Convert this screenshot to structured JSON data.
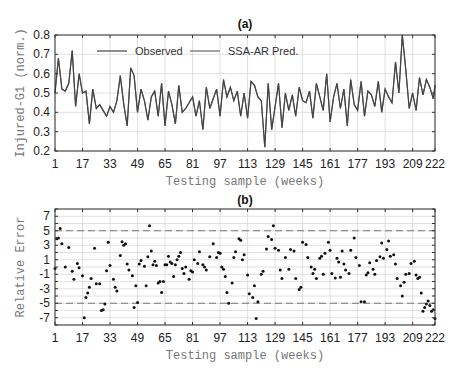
{
  "chart_data": [
    {
      "id": "a",
      "type": "line",
      "title": "(a)",
      "xlabel": "Testing sample (weeks)",
      "ylabel": "Injured-G1 (norm.)",
      "xlim": [
        1,
        222
      ],
      "ylim": [
        0.2,
        0.8
      ],
      "xticks": [
        1,
        17,
        33,
        49,
        65,
        81,
        97,
        113,
        129,
        145,
        161,
        177,
        193,
        209,
        222
      ],
      "yticks": [
        0.2,
        0.3,
        0.4,
        0.5,
        0.6,
        0.7,
        0.8
      ],
      "ytick_labels": [
        "0.2",
        "0.3",
        "0.4",
        "0.5",
        "0.6",
        "0.7",
        "0.8"
      ],
      "grid": true,
      "legend": {
        "position": "top",
        "entries": [
          "Observed",
          "SSA-AR Pred."
        ]
      },
      "series": [
        {
          "name": "Observed",
          "color": "#444444",
          "x": [
            1,
            3,
            5,
            7,
            9,
            11,
            13,
            15,
            17,
            19,
            21,
            23,
            25,
            27,
            29,
            31,
            33,
            35,
            37,
            39,
            41,
            43,
            45,
            47,
            49,
            51,
            53,
            55,
            57,
            59,
            61,
            63,
            65,
            67,
            69,
            71,
            73,
            75,
            77,
            79,
            81,
            83,
            85,
            87,
            89,
            91,
            93,
            95,
            97,
            99,
            101,
            103,
            105,
            107,
            109,
            111,
            113,
            115,
            117,
            119,
            121,
            123,
            125,
            127,
            129,
            131,
            133,
            135,
            137,
            139,
            141,
            143,
            145,
            147,
            149,
            151,
            153,
            155,
            157,
            159,
            161,
            163,
            165,
            167,
            169,
            171,
            173,
            175,
            177,
            179,
            181,
            183,
            185,
            187,
            189,
            191,
            193,
            195,
            197,
            199,
            201,
            203,
            205,
            207,
            209,
            211,
            213,
            215,
            217,
            219,
            221,
            222
          ],
          "values": [
            0.5,
            0.68,
            0.52,
            0.51,
            0.55,
            0.72,
            0.43,
            0.6,
            0.5,
            0.51,
            0.34,
            0.52,
            0.42,
            0.44,
            0.41,
            0.38,
            0.43,
            0.4,
            0.46,
            0.59,
            0.44,
            0.33,
            0.63,
            0.59,
            0.4,
            0.52,
            0.46,
            0.36,
            0.48,
            0.51,
            0.38,
            0.55,
            0.33,
            0.51,
            0.44,
            0.34,
            0.54,
            0.4,
            0.42,
            0.45,
            0.48,
            0.38,
            0.46,
            0.31,
            0.53,
            0.42,
            0.47,
            0.52,
            0.38,
            0.57,
            0.48,
            0.53,
            0.46,
            0.51,
            0.38,
            0.5,
            0.37,
            0.56,
            0.54,
            0.48,
            0.46,
            0.22,
            0.55,
            0.31,
            0.43,
            0.55,
            0.32,
            0.5,
            0.41,
            0.49,
            0.38,
            0.53,
            0.46,
            0.45,
            0.51,
            0.37,
            0.55,
            0.48,
            0.41,
            0.6,
            0.35,
            0.48,
            0.55,
            0.42,
            0.52,
            0.33,
            0.57,
            0.44,
            0.41,
            0.56,
            0.38,
            0.51,
            0.49,
            0.43,
            0.56,
            0.4,
            0.52,
            0.48,
            0.45,
            0.66,
            0.5,
            0.8,
            0.62,
            0.42,
            0.5,
            0.41,
            0.58,
            0.49,
            0.57,
            0.53,
            0.47,
            0.54,
            0.42,
            0.5,
            0.32,
            0.49,
            0.41,
            0.52,
            0.4,
            0.5,
            0.45,
            0.55,
            0.47,
            0.58,
            0.52,
            0.56
          ]
        },
        {
          "name": "SSA-AR Pred.",
          "color": "#666666",
          "note": "Prediction closely overlaps observed series"
        }
      ]
    },
    {
      "id": "b",
      "type": "scatter",
      "title": "(b)",
      "xlabel": "Testing sample (weeks)",
      "ylabel": "Relative Error",
      "xlim": [
        1,
        222
      ],
      "ylim": [
        -8,
        8
      ],
      "xticks": [
        1,
        17,
        33,
        49,
        65,
        81,
        97,
        113,
        129,
        145,
        161,
        177,
        193,
        209,
        222
      ],
      "yticks": [
        -7,
        -5,
        -3,
        -1,
        1,
        3,
        5,
        7
      ],
      "ytick_labels": [
        "-7",
        "-5",
        "-3",
        "-1",
        "1",
        "3",
        "5",
        "7"
      ],
      "grid": true,
      "reference_lines": [
        {
          "y": 5,
          "style": "dashed"
        },
        {
          "y": -5,
          "style": "dashed"
        }
      ],
      "series": [
        {
          "name": "Relative Error",
          "color": "#111111",
          "x": [
            1,
            2,
            3,
            4,
            5,
            7,
            9,
            11,
            12,
            14,
            15,
            17,
            18,
            19,
            20,
            21,
            22,
            24,
            25,
            27,
            28,
            29,
            30,
            31,
            32,
            33,
            35,
            36,
            37,
            39,
            40,
            41,
            42,
            43,
            44,
            46,
            47,
            48,
            49,
            50,
            51,
            53,
            54,
            55,
            56,
            57,
            58,
            59,
            60,
            61,
            62,
            63,
            64,
            65,
            66,
            67,
            68,
            69,
            70,
            71,
            72,
            73,
            74,
            75,
            76,
            77,
            79,
            80,
            81,
            82,
            84,
            85,
            87,
            88,
            89,
            91,
            93,
            95,
            96,
            97,
            98,
            99,
            100,
            101,
            102,
            104,
            105,
            106,
            108,
            109,
            110,
            111,
            113,
            114,
            116,
            117,
            118,
            119,
            121,
            122,
            124,
            125,
            127,
            128,
            129,
            131,
            132,
            133,
            135,
            137,
            138,
            140,
            141,
            143,
            144,
            145,
            147,
            148,
            150,
            151,
            152,
            153,
            155,
            156,
            157,
            158,
            160,
            161,
            162,
            164,
            165,
            166,
            167,
            168,
            169,
            170,
            172,
            173,
            175,
            176,
            178,
            179,
            181,
            182,
            183,
            184,
            186,
            187,
            188,
            190,
            191,
            192,
            194,
            195,
            196,
            198,
            199,
            200,
            202,
            203,
            204,
            205,
            207,
            208,
            210,
            211,
            212,
            213,
            214,
            215,
            216,
            217,
            218,
            219,
            220,
            221,
            222
          ],
          "values": [
            -0.2,
            3.9,
            4.0,
            5.3,
            3.2,
            0.0,
            2.7,
            -0.6,
            -1.7,
            0.5,
            -0.1,
            -1.2,
            -7.0,
            -4.2,
            -3.6,
            -2.8,
            -1.6,
            2.6,
            -2.3,
            -2.3,
            -6.0,
            -5.9,
            -5.1,
            -0.5,
            3.4,
            0.2,
            -1.7,
            -2.8,
            -3.3,
            1.6,
            3.5,
            3.0,
            3.2,
            0.4,
            -0.4,
            -1.2,
            -5.6,
            -2.6,
            -4.9,
            0.4,
            0.9,
            0.1,
            -2.6,
            1.4,
            5.7,
            2.2,
            0.3,
            0.8,
            0.2,
            -2.2,
            -2.0,
            -3.5,
            -2.0,
            0.3,
            0.3,
            1.5,
            0.7,
            0.5,
            -1.3,
            0.3,
            1.0,
            1.5,
            2.0,
            -0.2,
            -0.9,
            0.0,
            -1.7,
            -0.5,
            -0.7,
            1.0,
            0.5,
            2.1,
            0.3,
            0.0,
            -0.4,
            1.4,
            3.2,
            1.3,
            2.0,
            1.9,
            0.0,
            -0.3,
            -1.3,
            -3.5,
            -5.0,
            -2.2,
            1.3,
            2.1,
            3.9,
            3.7,
            1.0,
            1.7,
            -1.1,
            -3.7,
            -4.2,
            -2.6,
            -7.1,
            -4.8,
            -1.0,
            -0.6,
            2.5,
            4.2,
            3.8,
            5.7,
            2.6,
            2.3,
            -0.4,
            -1.6,
            1.3,
            -0.3,
            2.4,
            2.2,
            -1.6,
            -3.1,
            -2.8,
            3.4,
            3.1,
            1.3,
            0.0,
            -0.9,
            -0.3,
            -1.6,
            1.2,
            1.5,
            -1.0,
            1.9,
            3.4,
            2.3,
            -0.9,
            -1.5,
            1.2,
            0.7,
            -1.4,
            2.2,
            0.4,
            -0.4,
            -0.9,
            2.3,
            4.0,
            1.3,
            0.2,
            -4.8,
            -4.8,
            -1.1,
            -0.8,
            0.6,
            -0.3,
            -1.0,
            0.9,
            1.4,
            3.3,
            1.2,
            2.4,
            3.6,
            1.5,
            1.7,
            0.4,
            -1.6,
            -2.6,
            -4.0,
            -2.1,
            -1.0,
            -0.9,
            0.5,
            0.8,
            -1.1,
            -1.6,
            -1.4,
            -3.6,
            -6.1,
            -5.6,
            -5.1,
            -4.7,
            -5.3,
            -6.1,
            -5.9,
            -7.1,
            -5.4,
            -2.0,
            5.2,
            6.5,
            6.5,
            5.0,
            2.1,
            -0.8,
            -1.5,
            -3.2,
            -4.3,
            -4.6,
            -5.9,
            -5.9,
            -6.1,
            0.9,
            -0.9,
            -1.7,
            -3.5,
            8.2,
            4.8,
            3.0,
            -2.6,
            -0.8,
            -1.5,
            -2.3,
            -3.8,
            -5.3,
            -5.5,
            -6.2,
            -0.7,
            -3.3,
            -6.0,
            -2.2,
            0.6,
            -0.4,
            -4.0,
            -4.5,
            -5.4,
            -5.2,
            -5.7,
            -2.7,
            -2.7,
            -2.3,
            0.5,
            -2.2,
            -1.2,
            -1.7,
            0.1,
            2.1,
            1.8,
            3.0,
            5.0,
            4.0,
            3.2,
            2.5,
            2.4,
            3.1,
            2.4,
            2.9,
            2.1,
            1.5,
            0.8,
            1.9,
            1.8
          ]
        }
      ]
    }
  ],
  "plots": {
    "a": {
      "title": "(a)",
      "xlabel": "Testing sample (weeks)",
      "ylabel": "Injured-G1 (norm.)",
      "legend_observed": "Observed",
      "legend_pred": "SSA-AR Pred."
    },
    "b": {
      "title": "(b)",
      "xlabel": "Testing sample (weeks)",
      "ylabel": "Relative Error"
    }
  },
  "colors": {
    "line": "#444444",
    "grid": "#d8d8d8",
    "axis": "#333333",
    "marker": "#111111",
    "dashed": "#777777"
  }
}
